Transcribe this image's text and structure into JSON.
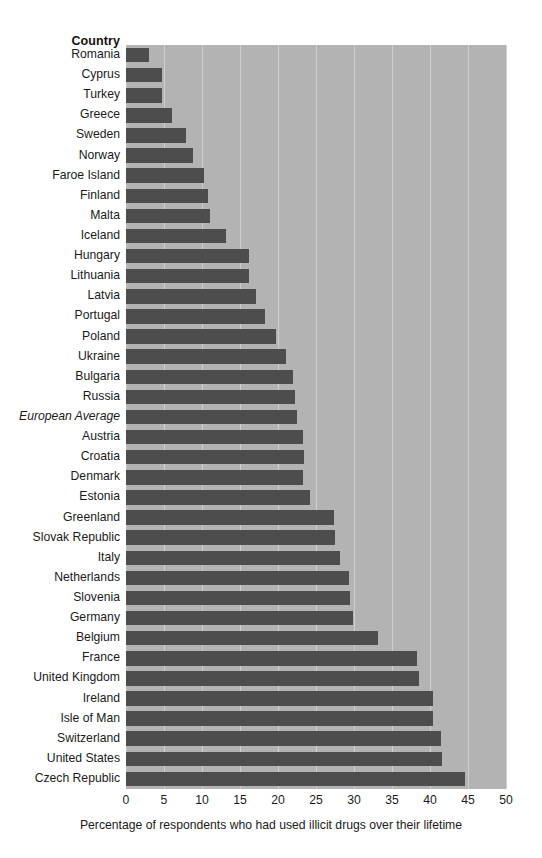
{
  "header": {
    "column_label": "Country"
  },
  "axis": {
    "x_title": "Percentage of respondents who had used illicit drugs over their lifetime",
    "x_ticks": [
      "0",
      "5",
      "10",
      "15",
      "20",
      "25",
      "30",
      "35",
      "40",
      "45",
      "50"
    ]
  },
  "colors": {
    "plot_background": "#b3b3b3",
    "bar_fill": "#4d4d4d",
    "gridline": "#cfcfcf",
    "page_background": "#ffffff",
    "text": "#1a1a1a"
  },
  "chart_data": {
    "type": "bar",
    "orientation": "horizontal",
    "title": "",
    "subtitle": "",
    "xlabel": "Percentage of respondents who had used illicit drugs over their lifetime",
    "ylabel": "Country",
    "xlim": [
      0,
      50
    ],
    "xticks": [
      0,
      5,
      10,
      15,
      20,
      25,
      30,
      35,
      40,
      45,
      50
    ],
    "grid": true,
    "legend": false,
    "categories": [
      "Romania",
      "Cyprus",
      "Turkey",
      "Greece",
      "Sweden",
      "Norway",
      "Faroe Island",
      "Finland",
      "Malta",
      "Iceland",
      "Hungary",
      "Lithuania",
      "Latvia",
      "Portugal",
      "Poland",
      "Ukraine",
      "Bulgaria",
      "Russia",
      "European Average",
      "Austria",
      "Croatia",
      "Denmark",
      "Estonia",
      "Greenland",
      "Slovak Republic",
      "Italy",
      "Netherlands",
      "Slovenia",
      "Germany",
      "Belgium",
      "France",
      "United Kingdom",
      "Ireland",
      "Isle of Man",
      "Switzerland",
      "United States",
      "Czech Republic"
    ],
    "values": [
      3.0,
      4.8,
      4.8,
      6.0,
      7.9,
      8.8,
      10.2,
      10.8,
      11.0,
      13.2,
      16.2,
      16.2,
      17.1,
      18.3,
      19.7,
      21.0,
      22.0,
      22.2,
      22.5,
      23.3,
      23.4,
      23.3,
      24.2,
      27.4,
      27.5,
      28.2,
      29.3,
      29.5,
      29.9,
      33.2,
      38.3,
      38.5,
      40.4,
      40.4,
      41.5,
      41.6,
      44.6
    ],
    "emphasis_category": "European Average"
  }
}
